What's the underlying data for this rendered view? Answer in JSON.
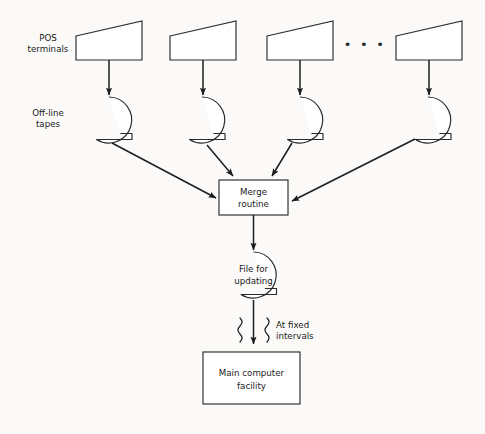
{
  "diagram": {
    "background_color": "#fbfaf8",
    "line_color": "#1d1d1d",
    "labels": {
      "pos_terminals_line1": "POS",
      "pos_terminals_line2": "terminals",
      "offline_tapes_line1": "Off-line",
      "offline_tapes_line2": "tapes",
      "ellipsis": "• • •",
      "merge_line1": "Merge",
      "merge_line2": "routine",
      "file_line1": "File for",
      "file_line2": "updating",
      "interval_line1": "At fixed",
      "interval_line2": "intervals",
      "main_line1": "Main computer",
      "main_line2": "facility"
    },
    "terminals": [
      {
        "id": "terminal-1",
        "x": 109
      },
      {
        "id": "terminal-2",
        "x": 203
      },
      {
        "id": "terminal-3",
        "x": 300
      },
      {
        "id": "terminal-4",
        "x": 429
      }
    ],
    "tapes": [
      {
        "id": "tape-1",
        "x": 109
      },
      {
        "id": "tape-2",
        "x": 202
      },
      {
        "id": "tape-3",
        "x": 300
      },
      {
        "id": "tape-4",
        "x": 428
      }
    ]
  }
}
